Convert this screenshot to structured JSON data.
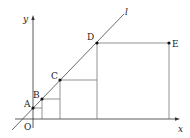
{
  "diagram": {
    "axes": {
      "x_label": "x",
      "y_label": "y",
      "origin_label": "O"
    },
    "line_label": "l",
    "points": [
      {
        "label": "A",
        "x": 33,
        "y": 108
      },
      {
        "label": "B",
        "x": 42,
        "y": 99
      },
      {
        "label": "C",
        "x": 60,
        "y": 80
      },
      {
        "label": "D",
        "x": 97,
        "y": 43
      },
      {
        "label": "E",
        "x": 169,
        "y": 43
      }
    ],
    "colors": {
      "stroke": "#555555",
      "axis": "#333333",
      "point": "#111111"
    }
  }
}
